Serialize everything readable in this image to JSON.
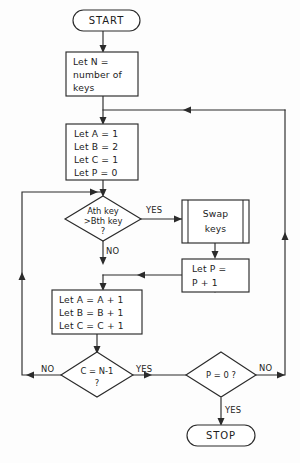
{
  "diagram": {
    "type": "flowchart",
    "stroke_color": "#2b2b2b",
    "fill_color": "#ffffff",
    "background_color": "#fdfdfd"
  },
  "nodes": {
    "start": {
      "kind": "terminal",
      "label": "START"
    },
    "init_n": {
      "kind": "process",
      "lines": [
        "Let N =",
        "number of",
        "keys"
      ]
    },
    "init_vars": {
      "kind": "process",
      "lines": [
        "Let A = 1",
        "Let B = 2",
        "Let C = 1",
        "Let P = 0"
      ]
    },
    "compare": {
      "kind": "decision",
      "lines": [
        "Ath key",
        ">Bth key",
        "?"
      ]
    },
    "swap": {
      "kind": "predefined-process",
      "lines": [
        "Swap",
        "keys"
      ]
    },
    "inc_p": {
      "kind": "process",
      "lines": [
        "Let P =",
        "P + 1"
      ]
    },
    "inc_abc": {
      "kind": "process",
      "lines": [
        "Let A = A + 1",
        "Let B = B + 1",
        "Let C = C + 1"
      ]
    },
    "check_c": {
      "kind": "decision",
      "lines": [
        "C = N-1",
        "?"
      ]
    },
    "check_p": {
      "kind": "decision",
      "lines": [
        "P = 0 ?"
      ]
    },
    "stop": {
      "kind": "terminal",
      "label": "STOP"
    }
  },
  "edge_labels": {
    "compare_yes": "YES",
    "compare_no": "NO",
    "check_c_no": "NO",
    "check_c_yes": "YES",
    "check_p_no": "NO",
    "check_p_yes": "YES"
  }
}
